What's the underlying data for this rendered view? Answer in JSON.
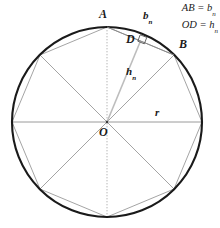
{
  "figure": {
    "title_semantic": "regular-polygon-inscribed-in-circle",
    "colors": {
      "circle_stroke": "#1a1a1a",
      "polygon_stroke": "#8a8a8a",
      "radius_stroke": "#8a8a8a",
      "apothem_stroke": "#b0b0b0",
      "axis_stroke": "#9a9a9a",
      "dotted_stroke": "#b5b5b5",
      "text": "#1a1a1a",
      "background": "#ffffff"
    },
    "geometry": {
      "center_x": 107,
      "center_y": 122,
      "radius": 95,
      "polygon_sides": 8
    }
  },
  "legend": {
    "lines": [
      {
        "left": "AB",
        "equals": " = ",
        "right": "b",
        "sub": "n"
      },
      {
        "left": "OD",
        "equals": " = ",
        "right": "h",
        "sub": "n"
      }
    ],
    "line1_full": "AB = b",
    "line1_sub": "n",
    "line2_full": "OD = h",
    "line2_sub": "n"
  },
  "labels": {
    "vertex_a": "A",
    "vertex_b": "B",
    "point_d": "D",
    "center_o": "O",
    "radius": "r",
    "side_base": "b",
    "side_sub": "n",
    "apothem_base": "h",
    "apothem_sub": "n"
  },
  "markers": {
    "right_angle": "right-angle-square"
  }
}
